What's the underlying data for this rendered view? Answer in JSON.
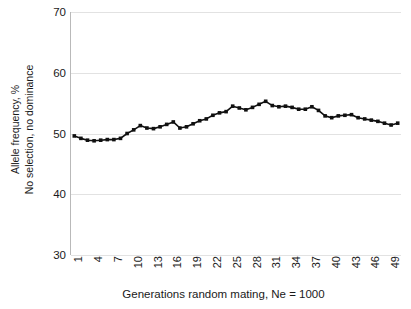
{
  "figure": {
    "clipped_title": "",
    "background_color": "#ffffff",
    "series_color": "#101010",
    "grid_color": "#e2e2e2",
    "axis_color": "#b9b9b9"
  },
  "axes": {
    "y_title_line1": "Allele frequency, %",
    "y_title_line2": "No selection, no dominance",
    "x_title": "Generations random mating, Ne = 1000",
    "y_ticks": [
      "70",
      "60",
      "50",
      "40",
      "30"
    ],
    "x_ticks": [
      "1",
      "4",
      "7",
      "10",
      "13",
      "16",
      "19",
      "22",
      "25",
      "28",
      "31",
      "34",
      "37",
      "40",
      "43",
      "46",
      "49"
    ]
  },
  "chart_data": {
    "type": "line",
    "title": "",
    "xlabel": "Generations random mating, Ne = 1000",
    "ylabel": "Allele frequency, %\nNo selection, no dominance",
    "xlim": [
      0.5,
      50.5
    ],
    "ylim": [
      30,
      70
    ],
    "yticks": [
      30,
      40,
      50,
      60,
      70
    ],
    "xticks": [
      1,
      4,
      7,
      10,
      13,
      16,
      19,
      22,
      25,
      28,
      31,
      34,
      37,
      40,
      43,
      46,
      49
    ],
    "grid": true,
    "grid_axis": "y",
    "legend": false,
    "marker": "square",
    "series": [
      {
        "name": "Allele frequency",
        "x": [
          1,
          2,
          3,
          4,
          5,
          6,
          7,
          8,
          9,
          10,
          11,
          12,
          13,
          14,
          15,
          16,
          17,
          18,
          19,
          20,
          21,
          22,
          23,
          24,
          25,
          26,
          27,
          28,
          29,
          30,
          31,
          32,
          33,
          34,
          35,
          36,
          37,
          38,
          39,
          40,
          41,
          42,
          43,
          44,
          45,
          46,
          47,
          48,
          49,
          50
        ],
        "values": [
          49.6,
          49.2,
          48.9,
          48.8,
          48.9,
          49.0,
          49.0,
          49.2,
          50.0,
          50.6,
          51.3,
          50.9,
          50.8,
          51.1,
          51.5,
          51.9,
          50.9,
          51.1,
          51.6,
          52.1,
          52.4,
          53.0,
          53.4,
          53.6,
          54.5,
          54.2,
          53.9,
          54.3,
          54.8,
          55.3,
          54.6,
          54.4,
          54.5,
          54.3,
          54.0,
          54.0,
          54.4,
          53.8,
          52.9,
          52.6,
          52.9,
          53.0,
          53.1,
          52.6,
          52.4,
          52.2,
          52.0,
          51.7,
          51.4,
          51.7
        ]
      }
    ]
  }
}
